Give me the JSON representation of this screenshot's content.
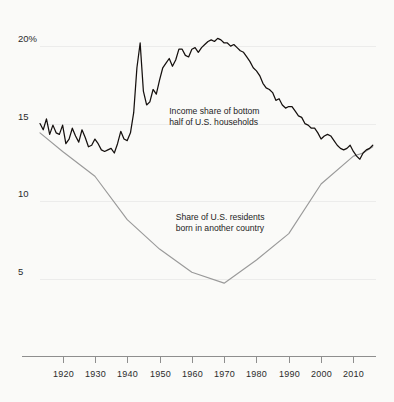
{
  "chart_data": {
    "type": "line",
    "title": "",
    "subtitle": "",
    "xlabel": "",
    "ylabel": "",
    "xlim": [
      1913,
      2017
    ],
    "ylim": [
      0,
      22.2
    ],
    "grid": true,
    "gridlines_y": [
      5,
      10,
      15,
      20
    ],
    "legend_position": "inline-annotations",
    "y_tick_labels": [
      "20%",
      "15",
      "10",
      "5"
    ],
    "y_tick_values": [
      20,
      15,
      10,
      5
    ],
    "x_tick_labels": [
      "1920",
      "1930",
      "1940",
      "1950",
      "1960",
      "1970",
      "1980",
      "1990",
      "2000",
      "2010"
    ],
    "x_tick_values": [
      1920,
      1930,
      1940,
      1950,
      1960,
      1970,
      1980,
      1990,
      2000,
      2010
    ],
    "colors": {
      "background": "#fafaf8",
      "income_series": "#15100e",
      "foreign_series": "#9a9a9a",
      "gridline": "#ececeb",
      "axis": "#8e8e8e",
      "text": "#1d1d1d"
    },
    "annotations": [
      {
        "name": "income-share-label",
        "lines": [
          "Income share of bottom",
          "half of U.S. households"
        ],
        "x": 1953,
        "y": 15.6
      },
      {
        "name": "foreign-born-label",
        "lines": [
          "Share of U.S. residents",
          "born in another country"
        ],
        "x": 1955,
        "y": 8.8
      }
    ],
    "series": [
      {
        "name": "Income share of bottom half of U.S. households",
        "color": "#15100e",
        "x": [
          1913,
          1914,
          1915,
          1916,
          1917,
          1918,
          1919,
          1920,
          1921,
          1922,
          1923,
          1924,
          1925,
          1926,
          1927,
          1928,
          1929,
          1930,
          1931,
          1932,
          1933,
          1934,
          1935,
          1936,
          1937,
          1938,
          1939,
          1940,
          1941,
          1942,
          1943,
          1944,
          1945,
          1946,
          1947,
          1948,
          1949,
          1950,
          1951,
          1952,
          1953,
          1954,
          1955,
          1956,
          1957,
          1958,
          1959,
          1960,
          1961,
          1962,
          1963,
          1964,
          1965,
          1966,
          1967,
          1968,
          1969,
          1970,
          1971,
          1972,
          1973,
          1974,
          1975,
          1976,
          1977,
          1978,
          1979,
          1980,
          1981,
          1982,
          1983,
          1984,
          1985,
          1986,
          1987,
          1988,
          1989,
          1990,
          1991,
          1992,
          1993,
          1994,
          1995,
          1996,
          1997,
          1998,
          1999,
          2000,
          2001,
          2002,
          2003,
          2004,
          2005,
          2006,
          2007,
          2008,
          2009,
          2010,
          2011,
          2012,
          2013,
          2014,
          2015,
          2016
        ],
        "values": [
          15.0,
          14.6,
          15.3,
          14.3,
          14.9,
          14.4,
          14.3,
          14.9,
          13.7,
          14.0,
          14.7,
          14.2,
          13.8,
          14.6,
          14.1,
          13.5,
          13.6,
          14.0,
          13.7,
          13.3,
          13.2,
          13.3,
          13.4,
          13.1,
          13.7,
          14.5,
          14.0,
          13.9,
          14.4,
          15.7,
          18.6,
          20.2,
          17.1,
          16.2,
          16.4,
          17.2,
          16.9,
          17.8,
          18.6,
          18.9,
          19.2,
          18.7,
          19.1,
          19.8,
          19.8,
          19.4,
          19.3,
          19.8,
          19.9,
          19.6,
          19.9,
          20.1,
          20.3,
          20.4,
          20.3,
          20.5,
          20.4,
          20.2,
          20.2,
          20.0,
          20.1,
          19.9,
          19.7,
          19.6,
          19.3,
          19.0,
          18.6,
          18.4,
          18.1,
          17.6,
          17.3,
          17.2,
          17.0,
          16.5,
          16.6,
          16.2,
          16.0,
          16.1,
          16.1,
          15.8,
          15.5,
          15.4,
          15.0,
          14.9,
          14.7,
          14.7,
          14.4,
          14.0,
          14.2,
          14.3,
          14.2,
          13.9,
          13.6,
          13.4,
          13.3,
          13.4,
          13.6,
          13.2,
          12.9,
          12.7,
          13.1,
          13.3,
          13.4,
          13.6
        ]
      },
      {
        "name": "Share of U.S. residents born in another country",
        "color": "#9a9a9a",
        "x": [
          1913,
          1920,
          1930,
          1940,
          1950,
          1960,
          1970,
          1980,
          1990,
          2000,
          2010,
          2013,
          2016
        ],
        "values": [
          14.4,
          13.2,
          11.6,
          8.8,
          6.9,
          5.4,
          4.7,
          6.2,
          7.9,
          11.1,
          12.9,
          13.1,
          13.5
        ]
      }
    ]
  },
  "meta": {
    "series_label_income": "Income share of bottom half of U.S. households",
    "series_label_foreign": "Share of U.S. residents born in another country"
  }
}
